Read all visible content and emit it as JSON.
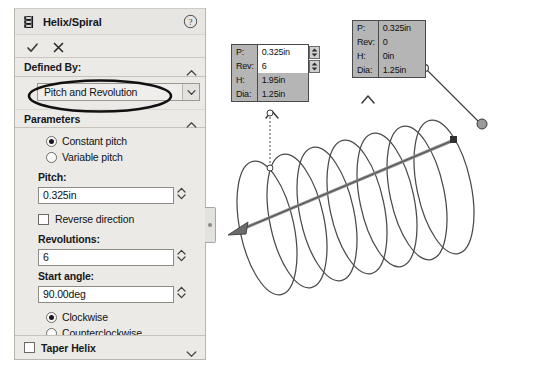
{
  "panel": {
    "title": "Helix/Spiral",
    "title_icon": "helix-icon",
    "help_icon": "help-circle-icon",
    "accept_icon": "checkmark-icon",
    "cancel_icon": "close-x-icon",
    "accent_color": "#eceae6",
    "groups": {
      "defined_by": {
        "label": "Defined By:",
        "collapse_icon": "chevron-up-icon",
        "dropdown": {
          "value": "Pitch and Revolution",
          "arrow_icon": "chevron-down-icon",
          "options": [
            "Pitch and Revolution",
            "Height and Revolution",
            "Height and Pitch",
            "Spiral"
          ]
        }
      },
      "parameters": {
        "label": "Parameters",
        "collapse_icon": "chevron-up-icon",
        "pitch_mode": {
          "constant": "Constant pitch",
          "variable": "Variable pitch",
          "selected": "constant"
        },
        "pitch": {
          "label": "Pitch:",
          "value": "0.325in",
          "spinner_icon": "spinner-updown-icon"
        },
        "reverse_direction": {
          "label": "Reverse direction",
          "checked": false
        },
        "revolutions": {
          "label": "Revolutions:",
          "value": "6",
          "spinner_icon": "spinner-updown-icon"
        },
        "start_angle": {
          "label": "Start angle:",
          "value": "90.00deg",
          "spinner_icon": "spinner-updown-icon"
        },
        "direction": {
          "clockwise": "Clockwise",
          "counterclockwise": "Counterclockwise",
          "selected": "clockwise"
        }
      },
      "taper_helix": {
        "label": "Taper Helix",
        "checked": false,
        "expand_icon": "chevron-down-icon"
      }
    },
    "edge_pin_icon": "panel-pin-icon"
  },
  "annotation": {
    "ellipse_color": "#111111",
    "target": "defined-by-dropdown"
  },
  "graphics": {
    "callouts": [
      {
        "name": "start-callout",
        "rows": [
          {
            "key": "P:",
            "value": "0.325in",
            "editable": true,
            "spinner": true
          },
          {
            "key": "Rev:",
            "value": "6",
            "editable": true,
            "spinner": true
          },
          {
            "key": "H:",
            "value": "1.95in",
            "editable": false,
            "spinner": false
          },
          {
            "key": "Dia:",
            "value": "1.25in",
            "editable": false,
            "spinner": false
          }
        ]
      },
      {
        "name": "end-callout",
        "rows": [
          {
            "key": "P:",
            "value": "0.325in",
            "editable": false,
            "spinner": false
          },
          {
            "key": "Rev:",
            "value": "0",
            "editable": false,
            "spinner": false
          },
          {
            "key": "H:",
            "value": "0in",
            "editable": false,
            "spinner": false
          },
          {
            "key": "Dia:",
            "value": "1.25in",
            "editable": false,
            "spinner": false
          }
        ]
      }
    ],
    "helix": {
      "revolutions": 6,
      "axis_arrow_icon": "axis-arrow-icon",
      "curve_color": "#4a4a4a",
      "handle_icon": "drag-handle-icon",
      "marker_up_icon": "chevron-up-marker-icon"
    }
  }
}
